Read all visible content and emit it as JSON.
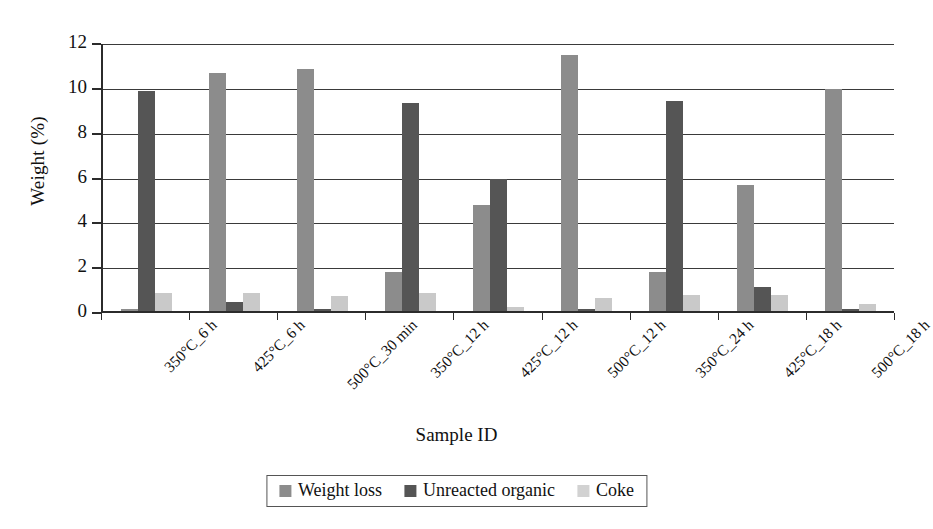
{
  "chart_data": {
    "type": "bar",
    "title": "",
    "xlabel": "Sample ID",
    "ylabel": "Weight (%)",
    "ylim": [
      0,
      12
    ],
    "yticks": [
      0,
      2,
      4,
      6,
      8,
      10,
      12
    ],
    "grid": true,
    "legend_position": "bottom",
    "categories": [
      "350°C_6 h",
      "425°C_6 h",
      "500°C_30 min",
      "350°C_12 h",
      "425°C_12 h",
      "500°C_12 h",
      "350°C_24 h",
      "425°C_18 h",
      "500°C_18 h"
    ],
    "series": [
      {
        "name": "Weight loss",
        "color": "#8c8c8c",
        "values": [
          0.1,
          10.6,
          10.8,
          1.75,
          4.75,
          11.4,
          1.75,
          5.6,
          9.9
        ]
      },
      {
        "name": "Unreacted organic",
        "color": "#555555",
        "values": [
          9.8,
          0.4,
          0.1,
          9.3,
          5.9,
          0.1,
          9.35,
          1.05,
          0.1
        ]
      },
      {
        "name": "Coke",
        "color": "#c9c9c9",
        "values": [
          0.8,
          0.8,
          0.65,
          0.8,
          0.2,
          0.6,
          0.7,
          0.7,
          0.3
        ]
      }
    ]
  }
}
